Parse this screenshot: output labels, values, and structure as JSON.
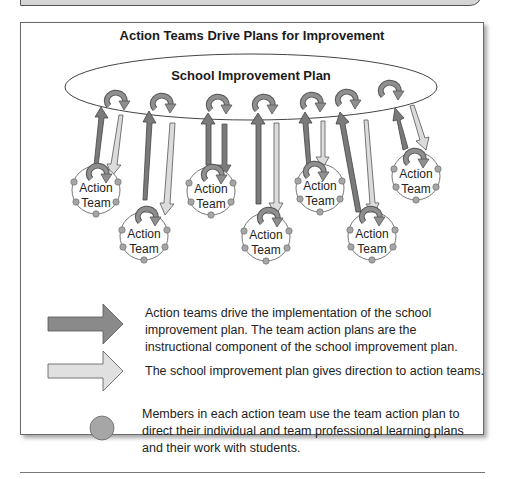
{
  "diagram": {
    "title": "Action Teams Drive Plans for Improvement",
    "center_label": "School Improvement Plan",
    "team_label_line1": "Action",
    "team_label_line2": "Team",
    "teams": [
      {
        "id": 1,
        "label": "Action Team"
      },
      {
        "id": 2,
        "label": "Action Team"
      },
      {
        "id": 3,
        "label": "Action Team"
      },
      {
        "id": 4,
        "label": "Action Team"
      },
      {
        "id": 5,
        "label": "Action Team"
      },
      {
        "id": 6,
        "label": "Action Team"
      },
      {
        "id": 7,
        "label": "Action Team"
      }
    ],
    "colors": {
      "dark_arrow": "#7a7a7a",
      "light_arrow": "#dcdcdc",
      "member_circle": "#a6a6a6",
      "outline": "#555555"
    }
  },
  "legend": {
    "items": [
      {
        "symbol": "dark-arrow",
        "text": "Action teams drive the implementation of the school improvement plan. The team action plans are the instructional component of the school improvement plan.",
        "lines": [
          "Action teams drive the implementation of the school",
          "improvement plan. The team action plans are the",
          "instructional component of the school improvement plan."
        ]
      },
      {
        "symbol": "light-arrow",
        "text": "The school improvement plan gives direction to action teams.",
        "lines": [
          "The school improvement plan gives direction to action teams."
        ]
      },
      {
        "symbol": "member-circle",
        "text": "Members in each action team use the team action plan to direct their individual and team professional learning plans and their work with students.",
        "lines": [
          "Members in each action team use the team action plan to",
          "direct their individual and team professional learning plans",
          "and their work with students."
        ]
      }
    ]
  }
}
